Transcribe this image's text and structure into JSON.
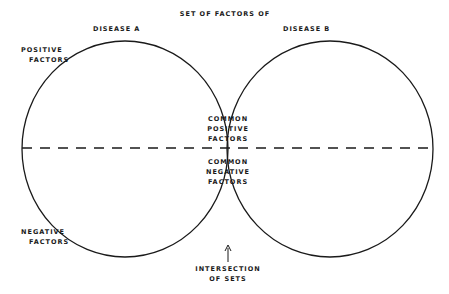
{
  "diagram": {
    "type": "venn",
    "title": "Set of factors of",
    "sets": [
      {
        "label": "Disease A"
      },
      {
        "label": "Disease B"
      }
    ],
    "side_labels": {
      "positive": [
        "Positive",
        "factors"
      ],
      "negative": [
        "Negative",
        "factors"
      ]
    },
    "overlap_labels": {
      "positive": [
        "Common",
        "positive",
        "factors"
      ],
      "negative": [
        "Common",
        "negative",
        "factors"
      ]
    },
    "annotation": [
      "Intersection",
      "of sets"
    ],
    "colors": {
      "line": "#1a1a1a",
      "background": "#ffffff"
    }
  }
}
